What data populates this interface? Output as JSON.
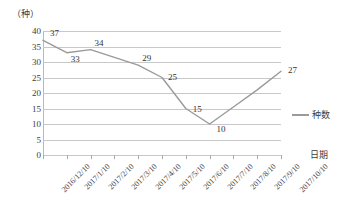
{
  "chart_data": {
    "type": "line",
    "title": "",
    "unit_label": "（种）",
    "xlabel": "日期",
    "ylabel": "",
    "ylim": [
      0,
      40
    ],
    "ytick_step": 5,
    "yticks": [
      40,
      35,
      30,
      25,
      20,
      15,
      10,
      5,
      0
    ],
    "grid": true,
    "legend_position": "right",
    "categories": [
      "2016/12/10",
      "2017/1/10",
      "2017/2/10",
      "2017/3/10",
      "2017/4/10",
      "2017/5/10",
      "2017/6/10",
      "2017/7/10",
      "2017/8/10",
      "2017/9/10",
      "2017/10/10"
    ],
    "series": [
      {
        "name": "种数",
        "color": "#9a9a9a",
        "values": [
          37,
          33,
          34,
          31.5,
          29,
          25,
          15,
          10,
          15.5,
          21,
          27
        ],
        "labeled_points": [
          {
            "index": 0,
            "value": 37
          },
          {
            "index": 1,
            "value": 33
          },
          {
            "index": 2,
            "value": 34
          },
          {
            "index": 4,
            "value": 29
          },
          {
            "index": 5,
            "value": 25
          },
          {
            "index": 6,
            "value": 15
          },
          {
            "index": 7,
            "value": 10
          },
          {
            "index": 10,
            "value": 27
          }
        ]
      }
    ],
    "data_labels": [
      "37",
      "33",
      "34",
      "29",
      "25",
      "15",
      "10",
      "27"
    ]
  },
  "legend": {
    "entries": [
      {
        "label": "种数"
      }
    ]
  }
}
